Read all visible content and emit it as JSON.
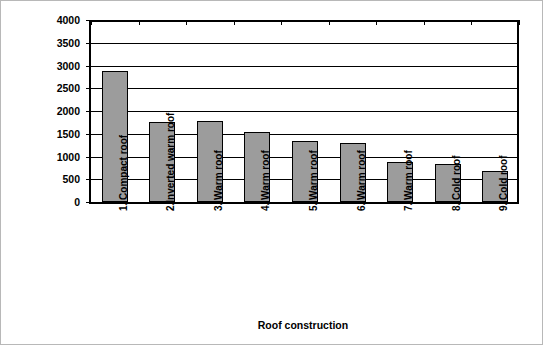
{
  "chart_data": {
    "type": "bar",
    "title": "",
    "xlabel": "Roof construction",
    "ylabel": "Embodied energy (Mj/m2)",
    "ylabel_text": "Embodied energy (Mj/m",
    "ylabel_sup": "2",
    "ylabel_tail": ")",
    "categories": [
      "1. Compact roof",
      "2.Inverted warm roof",
      "3. Warm roof",
      "4. Warm roof",
      "5. Warm roof",
      "6. Warm roof",
      "7. Warm roof",
      "8. Cold roof",
      "9. Cold roof"
    ],
    "values": [
      2880,
      1760,
      1780,
      1530,
      1350,
      1290,
      870,
      840,
      680
    ],
    "ylim": [
      0,
      4000
    ],
    "ytick_labels": [
      "0",
      "500",
      "1000",
      "1500",
      "2000",
      "2500",
      "3000",
      "3500",
      "4000"
    ],
    "ytick_values": [
      0,
      500,
      1000,
      1500,
      2000,
      2500,
      3000,
      3500,
      4000
    ],
    "grid": true,
    "legend": "none",
    "bar_color": "#9c9c9c",
    "bar_edge_color": "#000000",
    "axis_color": "#000000",
    "background": "#ffffff"
  }
}
